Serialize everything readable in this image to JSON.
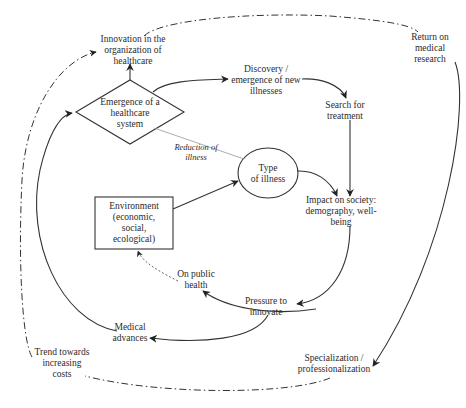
{
  "diagram": {
    "type": "causal-loop",
    "nodes": {
      "innovation_org": {
        "lines": [
          "Innovation in the",
          "organization of",
          "healthcare"
        ],
        "shape": "text"
      },
      "emergence_system": {
        "lines": [
          "Emergence of a",
          "healthcare",
          "system"
        ],
        "shape": "diamond"
      },
      "discovery": {
        "lines": [
          "Discovery /",
          "emergence of new",
          "illnesses"
        ],
        "shape": "text"
      },
      "search_treatment": {
        "lines": [
          "Search for",
          "treatment"
        ],
        "shape": "text"
      },
      "return_research": {
        "lines": [
          "Return on",
          "medical",
          "research"
        ],
        "shape": "text"
      },
      "reduction": {
        "lines": [
          "Reduction of",
          "illness"
        ],
        "shape": "italic-label"
      },
      "type_illness": {
        "lines": [
          "Type",
          "of illness"
        ],
        "shape": "ellipse"
      },
      "environment": {
        "lines": [
          "Environment",
          "(economic,",
          "social,",
          "ecological)"
        ],
        "shape": "box"
      },
      "impact_society": {
        "lines": [
          "Impact on society:",
          "demography, well-",
          "being"
        ],
        "shape": "text"
      },
      "public_health": {
        "lines": [
          "On public",
          "health"
        ],
        "shape": "text"
      },
      "pressure": {
        "lines": [
          "Pressure to",
          "innovate"
        ],
        "shape": "text"
      },
      "medical_adv": {
        "lines": [
          "Medical",
          "advances"
        ],
        "shape": "text"
      },
      "trend_costs": {
        "lines": [
          "Trend towards",
          "increasing",
          "costs"
        ],
        "shape": "text"
      },
      "specialization": {
        "lines": [
          "Specialization /",
          "professionalization"
        ],
        "shape": "text"
      }
    },
    "edges": [
      {
        "from": "emergence_system",
        "to": "innovation_org",
        "style": "solid"
      },
      {
        "from": "emergence_system",
        "to": "discovery",
        "style": "solid"
      },
      {
        "from": "discovery",
        "to": "search_treatment",
        "style": "solid"
      },
      {
        "from": "search_treatment",
        "to": "impact_society",
        "style": "solid"
      },
      {
        "from": "type_illness",
        "to": "impact_society",
        "style": "solid"
      },
      {
        "from": "environment",
        "to": "type_illness",
        "style": "solid"
      },
      {
        "from": "emergence_system",
        "to": "type_illness",
        "style": "thin",
        "label": "Reduction of illness"
      },
      {
        "from": "impact_society",
        "to": "pressure",
        "style": "solid"
      },
      {
        "from": "pressure",
        "to": "public_health",
        "style": "solid"
      },
      {
        "from": "public_health",
        "to": "environment",
        "style": "dashed"
      },
      {
        "from": "pressure",
        "to": "medical_adv",
        "style": "solid"
      },
      {
        "from": "medical_adv",
        "to": "emergence_system",
        "style": "solid"
      },
      {
        "from": "return_research",
        "to": "specialization",
        "style": "solid"
      },
      {
        "from": "specialization",
        "to": "trend_costs",
        "style": "dash-dot"
      },
      {
        "from": "trend_costs",
        "to": "innovation_org",
        "style": "dash-dot"
      },
      {
        "from": "innovation_org",
        "to": "return_research",
        "style": "dash-dot"
      }
    ]
  }
}
